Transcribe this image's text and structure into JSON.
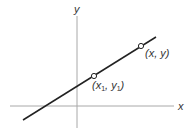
{
  "diagram": {
    "axes": {
      "x_label": "x",
      "y_label": "y",
      "color": "#a8a8a8"
    },
    "line": {
      "color": "#222222"
    },
    "points": [
      {
        "label_prefix": "(",
        "label_x": "x",
        "label_x_sub": "1",
        "label_sep": ", ",
        "label_y": "y",
        "label_y_sub": "1",
        "label_suffix": ")"
      },
      {
        "label": "(x, y)"
      }
    ]
  }
}
